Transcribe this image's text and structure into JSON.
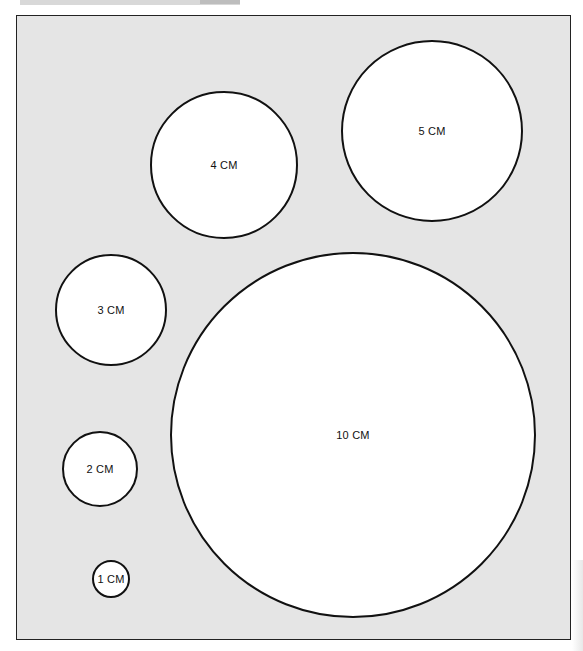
{
  "diagram": {
    "background_color": "#e5e5e5",
    "circle_fill": "#ffffff",
    "stroke_color": "#111111",
    "circles": [
      {
        "label": "5 CM",
        "diameter_cm": 5,
        "cx": 432,
        "cy": 131,
        "r": 91
      },
      {
        "label": "4 CM",
        "diameter_cm": 4,
        "cx": 224,
        "cy": 165,
        "r": 74
      },
      {
        "label": "3 CM",
        "diameter_cm": 3,
        "cx": 111,
        "cy": 310,
        "r": 56
      },
      {
        "label": "10 CM",
        "diameter_cm": 10,
        "cx": 353,
        "cy": 435,
        "r": 183
      },
      {
        "label": "2 CM",
        "diameter_cm": 2,
        "cx": 100,
        "cy": 469,
        "r": 38
      },
      {
        "label": "1 CM",
        "diameter_cm": 1,
        "cx": 111,
        "cy": 579,
        "r": 19
      }
    ]
  }
}
